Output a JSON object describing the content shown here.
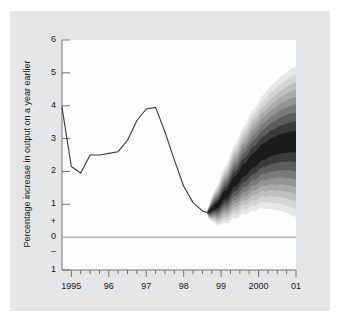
{
  "figure": {
    "name": "gdp-fan-chart",
    "panel_color": "#e4e6e8",
    "plot_background": "#fdfdfd",
    "line_color": "#3c3c3c",
    "fan_color": "#000000",
    "axis_color": "#6e7276"
  },
  "chart_data": {
    "type": "area",
    "title": "",
    "subtitle": "",
    "xlabel": "",
    "ylabel": "Percentage increase in output on a year earlier",
    "ylim": [
      -1,
      6
    ],
    "xlim": [
      1994.75,
      2001.0
    ],
    "grid": false,
    "legend": null,
    "y_tick_values": [
      6,
      5,
      4,
      3,
      2,
      1,
      0.45,
      0,
      -0.45,
      -1
    ],
    "y_tick_labels": [
      "6",
      "5",
      "4",
      "3",
      "2",
      "1",
      "+",
      "0",
      "–",
      "1"
    ],
    "x_tick_labels": [
      "1995",
      "96",
      "97",
      "98",
      "99",
      "2000",
      "01"
    ],
    "x_tick_values": [
      1995,
      1996,
      1997,
      1998,
      1999,
      2000,
      2001
    ],
    "x_minor_step": 0.25,
    "zero_line": 0,
    "series": [
      {
        "name": "GDP growth (actual)",
        "type": "line",
        "x": [
          1994.75,
          1995.0,
          1995.25,
          1995.5,
          1995.75,
          1996.0,
          1996.25,
          1996.5,
          1996.75,
          1997.0,
          1997.25,
          1997.5,
          1997.75,
          1998.0,
          1998.25,
          1998.5,
          1998.625
        ],
        "values": [
          3.95,
          2.15,
          1.95,
          2.5,
          2.5,
          2.55,
          2.6,
          2.95,
          3.55,
          3.9,
          3.95,
          3.2,
          2.35,
          1.55,
          1.05,
          0.8,
          0.75
        ]
      },
      {
        "name": "Projection central band",
        "type": "fan-center",
        "x": [
          1998.625,
          1998.875,
          1999.125,
          1999.375,
          1999.625,
          1999.875,
          2000.125,
          2000.375,
          2000.625,
          2000.875,
          2001.0
        ],
        "values": [
          0.75,
          0.95,
          1.3,
          1.7,
          2.05,
          2.35,
          2.6,
          2.75,
          2.85,
          2.9,
          2.9
        ]
      }
    ],
    "fan": {
      "description": "Probability-density fan of GDP growth projections, darkest at the central projection, fading outward",
      "start_x": 1998.625,
      "end_x": 2001.0,
      "bands": [
        {
          "probability": 10,
          "shade": "#1a1a1a",
          "half_width_end": 0.33
        },
        {
          "probability": 20,
          "shade": "#3a3a3a",
          "half_width_end": 0.62
        },
        {
          "probability": 30,
          "shade": "#5c5c5c",
          "half_width_end": 0.9
        },
        {
          "probability": 40,
          "shade": "#7a7a7a",
          "half_width_end": 1.15
        },
        {
          "probability": 50,
          "shade": "#949494",
          "half_width_end": 1.38
        },
        {
          "probability": 60,
          "shade": "#ababab",
          "half_width_end": 1.6
        },
        {
          "probability": 70,
          "shade": "#c0c0c0",
          "half_width_end": 1.82
        },
        {
          "probability": 80,
          "shade": "#d4d4d4",
          "half_width_end": 2.05
        },
        {
          "probability": 90,
          "shade": "#e6e6e6",
          "half_width_end": 2.3
        }
      ],
      "end_range": [
        1.2,
        4.4
      ]
    }
  }
}
